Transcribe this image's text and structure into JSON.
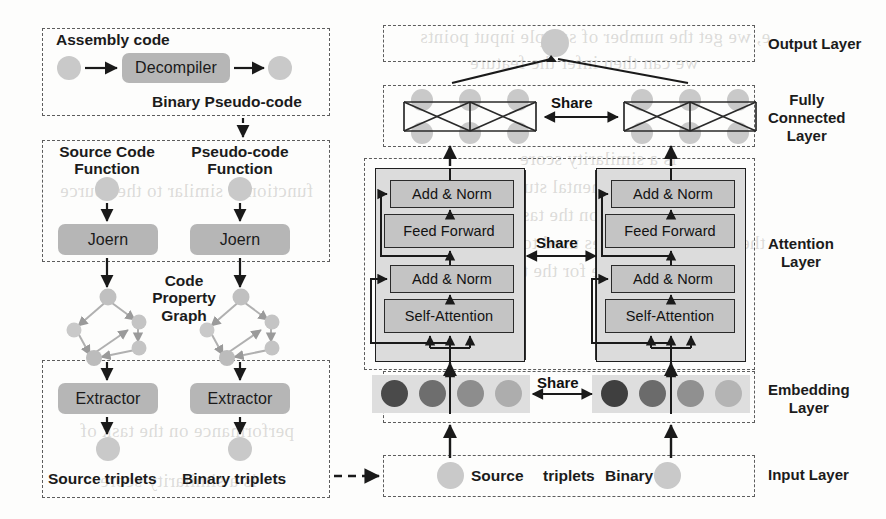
{
  "figure": {
    "type": "architecture-diagram"
  },
  "left_pipeline": {
    "decompile_stage": {
      "top_label": "Assembly code",
      "box_label": "Decompiler",
      "bottom_label": "Binary Pseudo-code"
    },
    "parse_stage": {
      "source_label_line1": "Source Code",
      "source_label_line2": "Function",
      "pseudo_label_line1": "Pseudo-code",
      "pseudo_label_line2": "Function",
      "left_box_label": "Joern",
      "right_box_label": "Joern"
    },
    "graph_stage": {
      "label_line1": "Code",
      "label_line2": "Property",
      "label_line3": "Graph"
    },
    "extract_stage": {
      "left_box_label": "Extractor",
      "right_box_label": "Extractor",
      "left_out_label": "Source triplets",
      "right_out_label": "Binary triplets"
    }
  },
  "right_model": {
    "layer_labels": {
      "output": "Output Layer",
      "fully_connected_line1": "Fully",
      "fully_connected_line2": "Connected",
      "fully_connected_line3": "Layer",
      "attention_line1": "Attention",
      "attention_line2": "Layer",
      "embedding_line1": "Embedding",
      "embedding_line2": "Layer",
      "input": "Input Layer"
    },
    "share_labels": {
      "fc": "Share",
      "attention": "Share",
      "embedding": "Share"
    },
    "attention_blocks": {
      "left": [
        "Add & Norm",
        "Feed Forward",
        "Add & Norm",
        "Self-Attention"
      ],
      "right": [
        "Add & Norm",
        "Feed Forward",
        "Add & Norm",
        "Self-Attention"
      ]
    },
    "input_layer": {
      "source_label": "Source",
      "triplets_label": "triplets",
      "binary_label": "Binary"
    },
    "embedding_tokens": {
      "left": [
        "#4a4a4a",
        "#6e6e6e",
        "#8d8d8d",
        "#adadad"
      ],
      "right": [
        "#3f3f3f",
        "#6b6b6b",
        "#909090",
        "#b4b4b4"
      ]
    }
  },
  "colors": {
    "process_box": "#b6b6b6",
    "transformer_box": "#c4c4c4",
    "transformer_block": "#dcdcdc",
    "node": "#c9c9c9",
    "dash_border": "#5d5d5d",
    "text": "#1b1b1b"
  },
  "background_text": {
    "lines": [
      "e, we get the number of sample input points",
      "we can then infer the feature",
      "is a similarity score",
      "the experimental study and",
      "performance on the task of",
      "the number of samples used to train",
      "the pseudo-code for the test",
      "function is similar to the source"
    ]
  }
}
